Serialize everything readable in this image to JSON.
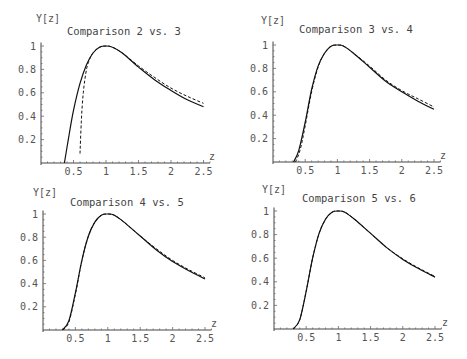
{
  "chart_data": [
    {
      "type": "line",
      "title": "Comparison 2 vs. 3",
      "xlabel": "z",
      "ylabel": "Y[z]",
      "xlim": [
        0,
        2.5
      ],
      "ylim": [
        0,
        1
      ],
      "x_ticks": [
        "0.5",
        "1",
        "1.5",
        "2",
        "2.5"
      ],
      "y_ticks": [
        "0.2",
        "0.4",
        "0.6",
        "0.8",
        "1"
      ],
      "grid": false,
      "series": [
        {
          "name": "solid",
          "style": "solid",
          "x": [
            0.36,
            0.42,
            0.5,
            0.6,
            0.7,
            0.8,
            0.9,
            1.0,
            1.1,
            1.25,
            1.5,
            1.75,
            2.0,
            2.25,
            2.5
          ],
          "y": [
            0.0,
            0.2,
            0.45,
            0.68,
            0.84,
            0.94,
            0.99,
            1.0,
            0.99,
            0.94,
            0.82,
            0.71,
            0.62,
            0.54,
            0.48
          ]
        },
        {
          "name": "dashed",
          "style": "dashed",
          "x": [
            0.6,
            0.62,
            0.65,
            0.7,
            0.75,
            0.8,
            0.9,
            1.0,
            1.1,
            1.25,
            1.5,
            1.75,
            2.0,
            2.25,
            2.5
          ],
          "y": [
            0.08,
            0.35,
            0.6,
            0.8,
            0.89,
            0.94,
            0.99,
            1.0,
            0.99,
            0.94,
            0.83,
            0.73,
            0.64,
            0.57,
            0.51
          ]
        }
      ]
    },
    {
      "type": "line",
      "title": "Comparison 3 vs. 4",
      "xlabel": "z",
      "ylabel": "Y[z]",
      "xlim": [
        0,
        2.5
      ],
      "ylim": [
        0,
        1
      ],
      "x_ticks": [
        "0.5",
        "1",
        "1.5",
        "2",
        "2.5"
      ],
      "y_ticks": [
        "0.2",
        "0.4",
        "0.6",
        "0.8",
        "1"
      ],
      "grid": false,
      "series": [
        {
          "name": "solid",
          "style": "solid",
          "x": [
            0.32,
            0.4,
            0.5,
            0.6,
            0.7,
            0.8,
            0.9,
            1.0,
            1.1,
            1.25,
            1.5,
            1.75,
            2.0,
            2.25,
            2.5
          ],
          "y": [
            0.0,
            0.1,
            0.34,
            0.62,
            0.82,
            0.93,
            0.99,
            1.0,
            0.99,
            0.93,
            0.81,
            0.69,
            0.6,
            0.52,
            0.45
          ]
        },
        {
          "name": "dashed",
          "style": "dashed",
          "x": [
            0.35,
            0.42,
            0.5,
            0.6,
            0.7,
            0.8,
            0.9,
            1.0,
            1.1,
            1.25,
            1.5,
            1.75,
            2.0,
            2.25,
            2.5
          ],
          "y": [
            0.0,
            0.1,
            0.31,
            0.6,
            0.81,
            0.93,
            0.99,
            1.0,
            0.99,
            0.93,
            0.82,
            0.7,
            0.61,
            0.54,
            0.47
          ]
        }
      ]
    },
    {
      "type": "line",
      "title": "Comparison 4 vs. 5",
      "xlabel": "z",
      "ylabel": "Y[z]",
      "xlim": [
        0,
        2.5
      ],
      "ylim": [
        0,
        1
      ],
      "x_ticks": [
        "0.5",
        "1",
        "1.5",
        "2",
        "2.5"
      ],
      "y_ticks": [
        "0.2",
        "0.4",
        "0.6",
        "0.8",
        "1"
      ],
      "grid": false,
      "series": [
        {
          "name": "solid",
          "style": "solid",
          "x": [
            0.3,
            0.4,
            0.5,
            0.6,
            0.7,
            0.8,
            0.9,
            1.0,
            1.1,
            1.25,
            1.5,
            1.75,
            2.0,
            2.25,
            2.5
          ],
          "y": [
            0.0,
            0.08,
            0.32,
            0.6,
            0.81,
            0.93,
            0.99,
            1.0,
            0.99,
            0.93,
            0.81,
            0.69,
            0.59,
            0.51,
            0.44
          ]
        },
        {
          "name": "dashed",
          "style": "dashed",
          "x": [
            0.31,
            0.4,
            0.5,
            0.6,
            0.7,
            0.8,
            0.9,
            1.0,
            1.1,
            1.25,
            1.5,
            1.75,
            2.0,
            2.25,
            2.5
          ],
          "y": [
            0.0,
            0.07,
            0.31,
            0.6,
            0.81,
            0.93,
            0.99,
            1.0,
            0.99,
            0.93,
            0.81,
            0.7,
            0.6,
            0.52,
            0.45
          ]
        }
      ]
    },
    {
      "type": "line",
      "title": "Comparison 5 vs. 6",
      "xlabel": "z",
      "ylabel": "Y[z]",
      "xlim": [
        0,
        2.5
      ],
      "ylim": [
        0,
        1
      ],
      "x_ticks": [
        "0.5",
        "1",
        "1.5",
        "2",
        "2.5"
      ],
      "y_ticks": [
        "0.2",
        "0.4",
        "0.6",
        "0.8",
        "1"
      ],
      "grid": false,
      "series": [
        {
          "name": "solid",
          "style": "solid",
          "x": [
            0.3,
            0.4,
            0.5,
            0.6,
            0.7,
            0.8,
            0.9,
            1.0,
            1.1,
            1.25,
            1.5,
            1.75,
            2.0,
            2.25,
            2.5
          ],
          "y": [
            0.0,
            0.08,
            0.32,
            0.6,
            0.81,
            0.93,
            0.99,
            1.0,
            0.99,
            0.93,
            0.81,
            0.69,
            0.59,
            0.51,
            0.44
          ]
        },
        {
          "name": "dashed",
          "style": "dashed",
          "x": [
            0.3,
            0.4,
            0.5,
            0.6,
            0.7,
            0.8,
            0.9,
            1.0,
            1.1,
            1.25,
            1.5,
            1.75,
            2.0,
            2.25,
            2.5
          ],
          "y": [
            0.0,
            0.08,
            0.32,
            0.6,
            0.81,
            0.93,
            0.99,
            1.0,
            0.99,
            0.93,
            0.81,
            0.69,
            0.595,
            0.515,
            0.445
          ]
        }
      ]
    }
  ],
  "panels": [
    {
      "title": "Comparison 2 vs. 3",
      "ylabel": "Y[z]",
      "xlabel": "z"
    },
    {
      "title": "Comparison 3 vs. 4",
      "ylabel": "Y[z]",
      "xlabel": "z"
    },
    {
      "title": "Comparison 4 vs. 5",
      "ylabel": "Y[z]",
      "xlabel": "z"
    },
    {
      "title": "Comparison 5 vs. 6",
      "ylabel": "Y[z]",
      "xlabel": "z"
    }
  ]
}
